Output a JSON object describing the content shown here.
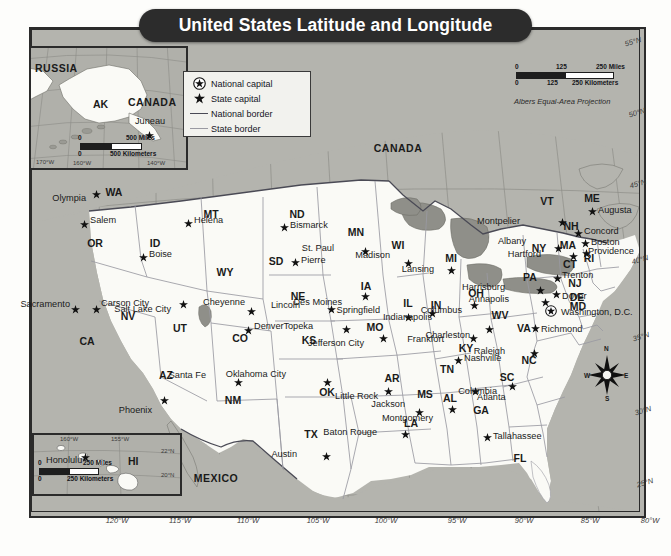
{
  "title": "United States Latitude and Longitude",
  "legend": {
    "items": [
      {
        "icon": "circled-star-icon",
        "label": "National capital"
      },
      {
        "icon": "star-icon",
        "label": "State capital"
      },
      {
        "icon": "thick-line-icon",
        "label": "National border"
      },
      {
        "icon": "thin-line-icon",
        "label": "State border"
      }
    ]
  },
  "projection_note": "Albers Equal-Area Projection",
  "main_scale": {
    "miles": {
      "ticks": [
        "0",
        "125",
        "250"
      ],
      "unit": "Miles"
    },
    "kilometers": {
      "ticks": [
        "0",
        "125",
        "250"
      ],
      "unit": "Kilometers"
    }
  },
  "insets": {
    "alaska": {
      "name": "Alaska inset",
      "labels": [
        "RUSSIA",
        "AK",
        "CANADA"
      ],
      "capital": "Juneau",
      "scale": {
        "miles": {
          "ticks": [
            "0",
            "500"
          ],
          "unit": "Miles"
        },
        "kilometers": {
          "ticks": [
            "0",
            "500"
          ],
          "unit": "Kilometers"
        }
      },
      "coords": [
        "170°W",
        "160°W",
        "140°W"
      ]
    },
    "hawaii": {
      "name": "Hawaii inset",
      "labels": [
        "HI"
      ],
      "capital": "Honolulu",
      "scale": {
        "miles": {
          "ticks": [
            "0",
            "250"
          ],
          "unit": "Miles"
        },
        "kilometers": {
          "ticks": [
            "0",
            "250"
          ],
          "unit": "Kilometers"
        }
      },
      "coords": [
        "160°W",
        "155°W",
        "22°N",
        "20°N"
      ]
    }
  },
  "countries": [
    {
      "name": "CANADA",
      "x": 398,
      "y": 148
    },
    {
      "name": "MEXICO",
      "x": 216,
      "y": 478
    }
  ],
  "compass": {
    "n": "N",
    "e": "E",
    "w": "W",
    "s": "S"
  },
  "longitude_labels": [
    {
      "text": "120°W",
      "x": 117,
      "y": 521
    },
    {
      "text": "115°W",
      "x": 180,
      "y": 521
    },
    {
      "text": "110°W",
      "x": 248,
      "y": 521
    },
    {
      "text": "105°W",
      "x": 318,
      "y": 521
    },
    {
      "text": "100°W",
      "x": 386,
      "y": 521
    },
    {
      "text": "95°W",
      "x": 457,
      "y": 521
    },
    {
      "text": "90°W",
      "x": 524,
      "y": 521
    },
    {
      "text": "85°W",
      "x": 590,
      "y": 521
    },
    {
      "text": "80°W",
      "x": 650,
      "y": 521
    },
    {
      "text": "75°W",
      "x": 710,
      "y": 521
    }
  ],
  "latitude_labels": [
    {
      "text": "55°N",
      "x": 633,
      "y": 42
    },
    {
      "text": "50°N",
      "x": 637,
      "y": 113
    },
    {
      "text": "45°N",
      "x": 638,
      "y": 184
    },
    {
      "text": "40°N",
      "x": 640,
      "y": 260
    },
    {
      "text": "35°N",
      "x": 641,
      "y": 337
    },
    {
      "text": "30°N",
      "x": 643,
      "y": 411
    },
    {
      "text": "25°N",
      "x": 645,
      "y": 483
    }
  ],
  "states": [
    {
      "abbr": "WA",
      "x": 114,
      "y": 192
    },
    {
      "abbr": "OR",
      "x": 95,
      "y": 243
    },
    {
      "abbr": "CA",
      "x": 87,
      "y": 341
    },
    {
      "abbr": "NV",
      "x": 128,
      "y": 316
    },
    {
      "abbr": "ID",
      "x": 155,
      "y": 243
    },
    {
      "abbr": "MT",
      "x": 211,
      "y": 214
    },
    {
      "abbr": "WY",
      "x": 225,
      "y": 272
    },
    {
      "abbr": "UT",
      "x": 180,
      "y": 328
    },
    {
      "abbr": "AZ",
      "x": 166,
      "y": 375
    },
    {
      "abbr": "NM",
      "x": 233,
      "y": 400
    },
    {
      "abbr": "CO",
      "x": 240,
      "y": 338
    },
    {
      "abbr": "ND",
      "x": 297,
      "y": 214
    },
    {
      "abbr": "SD",
      "x": 276,
      "y": 261
    },
    {
      "abbr": "NE",
      "x": 298,
      "y": 296
    },
    {
      "abbr": "KS",
      "x": 309,
      "y": 340
    },
    {
      "abbr": "OK",
      "x": 327,
      "y": 392
    },
    {
      "abbr": "TX",
      "x": 311,
      "y": 434
    },
    {
      "abbr": "MN",
      "x": 356,
      "y": 232
    },
    {
      "abbr": "IA",
      "x": 366,
      "y": 286
    },
    {
      "abbr": "MO",
      "x": 375,
      "y": 327
    },
    {
      "abbr": "AR",
      "x": 392,
      "y": 378
    },
    {
      "abbr": "LA",
      "x": 411,
      "y": 423
    },
    {
      "abbr": "WI",
      "x": 398,
      "y": 245
    },
    {
      "abbr": "IL",
      "x": 408,
      "y": 303
    },
    {
      "abbr": "MS",
      "x": 425,
      "y": 394
    },
    {
      "abbr": "MI",
      "x": 451,
      "y": 258
    },
    {
      "abbr": "IN",
      "x": 436,
      "y": 305
    },
    {
      "abbr": "AL",
      "x": 450,
      "y": 398
    },
    {
      "abbr": "TN",
      "x": 447,
      "y": 369
    },
    {
      "abbr": "KY",
      "x": 466,
      "y": 348
    },
    {
      "abbr": "OH",
      "x": 476,
      "y": 293
    },
    {
      "abbr": "GA",
      "x": 481,
      "y": 410
    },
    {
      "abbr": "WV",
      "x": 500,
      "y": 315
    },
    {
      "abbr": "SC",
      "x": 507,
      "y": 377
    },
    {
      "abbr": "NC",
      "x": 529,
      "y": 360
    },
    {
      "abbr": "FL",
      "x": 520,
      "y": 458
    },
    {
      "abbr": "VA",
      "x": 524,
      "y": 328
    },
    {
      "abbr": "PA",
      "x": 530,
      "y": 277
    },
    {
      "abbr": "NY",
      "x": 539,
      "y": 248
    },
    {
      "abbr": "VT",
      "x": 547,
      "y": 201
    },
    {
      "abbr": "NH",
      "x": 571,
      "y": 226
    },
    {
      "abbr": "ME",
      "x": 592,
      "y": 198
    },
    {
      "abbr": "MA",
      "x": 568,
      "y": 245
    },
    {
      "abbr": "CT",
      "x": 570,
      "y": 264
    },
    {
      "abbr": "RI",
      "x": 589,
      "y": 258
    },
    {
      "abbr": "NJ",
      "x": 575,
      "y": 283
    },
    {
      "abbr": "DE",
      "x": 577,
      "y": 297
    },
    {
      "abbr": "MD",
      "x": 578,
      "y": 306
    }
  ],
  "capitals": [
    {
      "city": "Olympia",
      "sx": 96,
      "sy": 194,
      "lx": 86,
      "ly": 199,
      "anchor": "left"
    },
    {
      "city": "Salem",
      "sx": 84,
      "sy": 224,
      "lx": 90,
      "ly": 221,
      "anchor": "right"
    },
    {
      "city": "Boise",
      "sx": 143,
      "sy": 257,
      "lx": 149,
      "ly": 255,
      "anchor": "right"
    },
    {
      "city": "Helena",
      "sx": 188,
      "sy": 223,
      "lx": 194,
      "ly": 221,
      "anchor": "right"
    },
    {
      "city": "Sacramento",
      "sx": 75,
      "sy": 309,
      "lx": 70,
      "ly": 305,
      "anchor": "left"
    },
    {
      "city": "Carson City",
      "sx": 96,
      "sy": 309,
      "lx": 101,
      "ly": 304,
      "anchor": "right"
    },
    {
      "city": "Salt Lake City",
      "sx": 183,
      "sy": 304,
      "lx": 171,
      "ly": 310,
      "anchor": "left"
    },
    {
      "city": "Cheyenne",
      "sx": 251,
      "sy": 311,
      "lx": 245,
      "ly": 303,
      "anchor": "left"
    },
    {
      "city": "Denver",
      "sx": 248,
      "sy": 330,
      "lx": 254,
      "ly": 327,
      "anchor": "right"
    },
    {
      "city": "Phoenix",
      "sx": 164,
      "sy": 400,
      "lx": 152,
      "ly": 411,
      "anchor": "left"
    },
    {
      "city": "Santa Fe",
      "sx": 238,
      "sy": 382,
      "lx": 206,
      "ly": 376,
      "anchor": "left"
    },
    {
      "city": "Bismarck",
      "sx": 284,
      "sy": 227,
      "lx": 290,
      "ly": 226,
      "anchor": "right"
    },
    {
      "city": "Pierre",
      "sx": 295,
      "sy": 262,
      "lx": 301,
      "ly": 261,
      "anchor": "right"
    },
    {
      "city": "Lincoln",
      "sx": 331,
      "sy": 309,
      "lx": 300,
      "ly": 306,
      "anchor": "left"
    },
    {
      "city": "Topeka",
      "sx": 346,
      "sy": 329,
      "lx": 313,
      "ly": 327,
      "anchor": "left"
    },
    {
      "city": "Oklahoma City",
      "sx": 327,
      "sy": 382,
      "lx": 286,
      "ly": 375,
      "anchor": "left"
    },
    {
      "city": "Austin",
      "sx": 326,
      "sy": 456,
      "lx": 297,
      "ly": 455,
      "anchor": "left"
    },
    {
      "city": "St. Paul",
      "sx": 365,
      "sy": 251,
      "lx": 334,
      "ly": 249,
      "anchor": "left"
    },
    {
      "city": "Des Moines",
      "sx": 365,
      "sy": 296,
      "lx": 342,
      "ly": 303,
      "anchor": "left"
    },
    {
      "city": "Jefferson City",
      "sx": 383,
      "sy": 338,
      "lx": 364,
      "ly": 344,
      "anchor": "left"
    },
    {
      "city": "Little Rock",
      "sx": 388,
      "sy": 391,
      "lx": 378,
      "ly": 397,
      "anchor": "left"
    },
    {
      "city": "Baton Rouge",
      "sx": 405,
      "sy": 434,
      "lx": 377,
      "ly": 433,
      "anchor": "left"
    },
    {
      "city": "Jackson",
      "sx": 419,
      "sy": 412,
      "lx": 405,
      "ly": 405,
      "anchor": "left"
    },
    {
      "city": "Madison",
      "sx": 408,
      "sy": 263,
      "lx": 390,
      "ly": 256,
      "anchor": "left"
    },
    {
      "city": "Springfield",
      "sx": 408,
      "sy": 317,
      "lx": 380,
      "ly": 311,
      "anchor": "left"
    },
    {
      "city": "Indianapolis",
      "sx": 432,
      "sy": 313,
      "lx": 432,
      "ly": 318,
      "anchor": "left"
    },
    {
      "city": "Lansing",
      "sx": 451,
      "sy": 270,
      "lx": 434,
      "ly": 270,
      "anchor": "left"
    },
    {
      "city": "Nashville",
      "sx": 458,
      "sy": 360,
      "lx": 464,
      "ly": 359,
      "anchor": "right"
    },
    {
      "city": "Frankfort",
      "sx": 473,
      "sy": 338,
      "lx": 444,
      "ly": 340,
      "anchor": "left"
    },
    {
      "city": "Columbus",
      "sx": 474,
      "sy": 305,
      "lx": 462,
      "ly": 311,
      "anchor": "left"
    },
    {
      "city": "Charleston",
      "sx": 489,
      "sy": 329,
      "lx": 470,
      "ly": 336,
      "anchor": "left"
    },
    {
      "city": "Montgomery",
      "sx": 452,
      "sy": 409,
      "lx": 433,
      "ly": 419,
      "anchor": "left"
    },
    {
      "city": "Atlanta",
      "sx": 475,
      "sy": 391,
      "lx": 477,
      "ly": 398,
      "anchor": "right"
    },
    {
      "city": "Tallahassee",
      "sx": 487,
      "sy": 437,
      "lx": 493,
      "ly": 437,
      "anchor": "right"
    },
    {
      "city": "Columbia",
      "sx": 512,
      "sy": 386,
      "lx": 497,
      "ly": 392,
      "anchor": "left"
    },
    {
      "city": "Raleigh",
      "sx": 534,
      "sy": 353,
      "lx": 505,
      "ly": 352,
      "anchor": "left"
    },
    {
      "city": "Richmond",
      "sx": 535,
      "sy": 328,
      "lx": 541,
      "ly": 330,
      "anchor": "right"
    },
    {
      "city": "Harrisburg",
      "sx": 540,
      "sy": 290,
      "lx": 505,
      "ly": 288,
      "anchor": "left"
    },
    {
      "city": "Annapolis",
      "sx": 545,
      "sy": 302,
      "lx": 509,
      "ly": 300,
      "anchor": "left"
    },
    {
      "city": "Trenton",
      "sx": 557,
      "sy": 278,
      "lx": 562,
      "ly": 276,
      "anchor": "right"
    },
    {
      "city": "Dover",
      "sx": 556,
      "sy": 294,
      "lx": 562,
      "ly": 297,
      "anchor": "right"
    },
    {
      "city": "Hartford",
      "sx": 573,
      "sy": 256,
      "lx": 541,
      "ly": 255,
      "anchor": "left"
    },
    {
      "city": "Albany",
      "sx": 558,
      "sy": 248,
      "lx": 526,
      "ly": 242,
      "anchor": "left"
    },
    {
      "city": "Montpelier",
      "sx": 562,
      "sy": 222,
      "lx": 520,
      "ly": 222,
      "anchor": "left"
    },
    {
      "city": "Concord",
      "sx": 578,
      "sy": 233,
      "lx": 584,
      "ly": 232,
      "anchor": "right"
    },
    {
      "city": "Boston",
      "sx": 585,
      "sy": 243,
      "lx": 591,
      "ly": 243,
      "anchor": "right"
    },
    {
      "city": "Providence",
      "sx": 586,
      "sy": 253,
      "lx": 588,
      "ly": 252,
      "anchor": "right"
    },
    {
      "city": "Augusta",
      "sx": 592,
      "sy": 211,
      "lx": 598,
      "ly": 211,
      "anchor": "right"
    }
  ],
  "national_capital": {
    "city": "Washington, D.C.",
    "sx": 551,
    "sy": 311,
    "lx": 561,
    "ly": 313
  }
}
